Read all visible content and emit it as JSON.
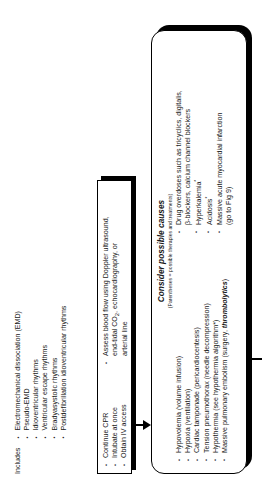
{
  "diagram": {
    "orientation": "rotated-90-ccw",
    "colors": {
      "line": "#000000",
      "background": "#ffffff",
      "text": "#1a1a1a"
    }
  },
  "includes": {
    "label": "Includes",
    "items": [
      "Electromechanical dissociation (EMD)",
      "Pseudo-EMD",
      "Idioventricular rhythms",
      "Ventricular escape rhythms",
      "Bradyasystolic rhythms",
      "Postdefibrillation idioventricular rhythms"
    ]
  },
  "interventions": {
    "left_items": [
      "Continue CPR",
      "Intubate at once",
      "Obtain IV access"
    ],
    "right_items": [
      "Assess blood flow using Doppler ultrasound, end-tidal CO2, echocardiography, or arterial line"
    ],
    "right_item_parts": {
      "line1_a": "Assess blood flow using Doppler ultrasound,",
      "line2_a": "end-tidal CO",
      "line2_sub": "2",
      "line2_b": ", echocardiography, or",
      "line3": "arterial line"
    }
  },
  "causes": {
    "title": "Consider possible causes",
    "subtitle": "(Parentheses = possible therapies and treatments)",
    "left_items": [
      "Hypovolemia (volume infusion)",
      "Hypoxia (ventilation)",
      "Cardiac tamponade (pericardiocentesis)",
      "Tension pneumothorax (needle decompression)",
      "Hypothermia (see hypothermia algorithm*)"
    ],
    "last_left_item": {
      "prefix": "Massive pulmonary embolism (surgery, ",
      "emphasis": "thrombolytics",
      "suffix": ")"
    },
    "right_items_parts": {
      "drug_line1": "Drug overdoses such as tricyclics, digitalis,",
      "drug_line2": "β-blockers, calcium channel blockers",
      "hyperkalemia": "Hyperkalemia",
      "hyperkalemia_sup": "*",
      "acidosis": "Acidosis",
      "acidosis_sup": "*",
      "mi_line1": "Massive acute myocardial infarction",
      "mi_line2": "(go to Fig 9)"
    }
  }
}
